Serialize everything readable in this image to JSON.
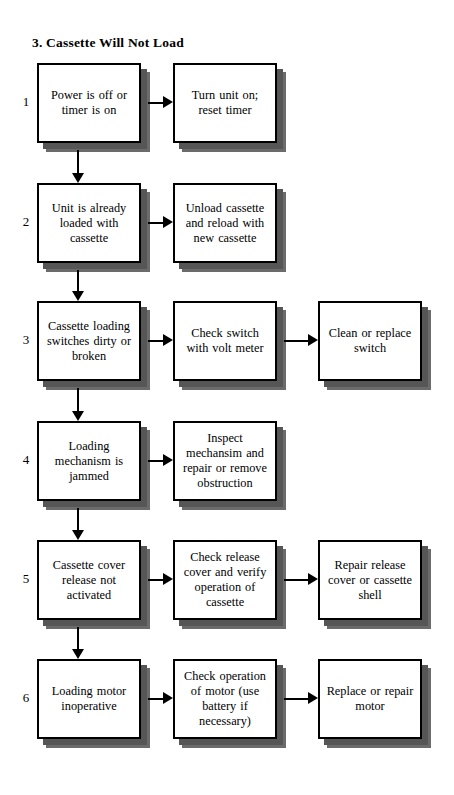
{
  "title": "3. Cassette Will Not Load",
  "layout": {
    "col1_x": 37,
    "col2_x": 173,
    "col3_x": 318,
    "box_w": 104,
    "box_h": 80,
    "row_y": [
      63,
      183,
      301,
      421,
      540,
      659
    ],
    "num_x": 18,
    "shadow_offset": 6
  },
  "rows": [
    {
      "number": "1",
      "problem": "Power is off or timer is on",
      "action": "Turn unit on; reset timer",
      "followup": null
    },
    {
      "number": "2",
      "problem": "Unit is already loaded with cassette",
      "action": "Unload cassette and reload with new cassette",
      "followup": null
    },
    {
      "number": "3",
      "problem": "Cassette loading switches dirty or broken",
      "action": "Check switch with volt meter",
      "followup": "Clean or replace switch"
    },
    {
      "number": "4",
      "problem": "Loading mechanism is jammed",
      "action": "Inspect mechansim and repair or remove obstruction",
      "followup": null
    },
    {
      "number": "5",
      "problem": "Cassette cover release not activated",
      "action": "Check release cover and verify operation of cassette",
      "followup": "Repair release cover or cassette shell"
    },
    {
      "number": "6",
      "problem": "Loading motor inoperative",
      "action": "Check operation of motor (use battery if necessary)",
      "followup": "Replace or repair motor"
    }
  ],
  "colors": {
    "line": "#000000",
    "shadow": "#565656",
    "box_fill": "#ffffff",
    "page_bg": "#ffffff"
  }
}
